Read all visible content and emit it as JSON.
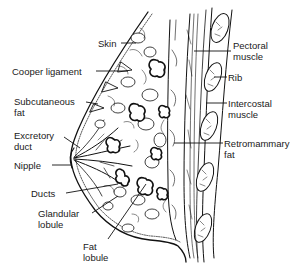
{
  "diagram": {
    "labels": [
      {
        "id": "skin",
        "text": "Skin",
        "x": 98,
        "y": 38
      },
      {
        "id": "cooper-ligament",
        "text": "Cooper ligament",
        "x": 12,
        "y": 66
      },
      {
        "id": "subcutaneous-fat",
        "text": "Subcutaneous\nfat",
        "x": 14,
        "y": 96
      },
      {
        "id": "excretory-duct",
        "text": "Excretory\nduct",
        "x": 14,
        "y": 130
      },
      {
        "id": "nipple",
        "text": "Nipple",
        "x": 14,
        "y": 161
      },
      {
        "id": "ducts",
        "text": "Ducts",
        "x": 31,
        "y": 189
      },
      {
        "id": "glandular-lobule",
        "text": "Glandular\nlobule",
        "x": 38,
        "y": 210
      },
      {
        "id": "fat-lobule",
        "text": "Fat\nlobule",
        "x": 83,
        "y": 241
      },
      {
        "id": "pectoral-muscle",
        "text": "Pectoral\nmuscle",
        "x": 233,
        "y": 40
      },
      {
        "id": "rib",
        "text": "Rib",
        "x": 228,
        "y": 73
      },
      {
        "id": "intercostal-muscle",
        "text": "Intercostal\nmuscle",
        "x": 228,
        "y": 99
      },
      {
        "id": "retromammary-fat",
        "text": "Retromammary\nfat",
        "x": 224,
        "y": 139
      }
    ]
  }
}
